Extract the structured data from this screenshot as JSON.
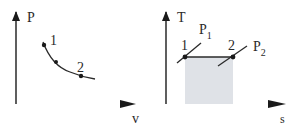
{
  "diagrams": [
    {
      "id": "pv",
      "title": "P-v diagram",
      "y_axis_label": "P",
      "x_axis_label": "v",
      "points": [
        {
          "label": "1"
        },
        {
          "label": "2"
        }
      ],
      "curve": "isothermal/expansion curve from state 1 to state 2"
    },
    {
      "id": "ts",
      "title": "T-s diagram",
      "y_axis_label": "T",
      "x_axis_label": "s",
      "points": [
        {
          "label": "1"
        },
        {
          "label": "2"
        }
      ],
      "isobars": [
        {
          "label": "P",
          "subscript": "1"
        },
        {
          "label": "P",
          "subscript": "2"
        }
      ],
      "shaded_area": "area under process 1-2 (heat transfer)"
    }
  ],
  "colors": {
    "line": "#2a2a2a",
    "axis_tint": "#c48a8a",
    "shade": "#dde1e6"
  }
}
